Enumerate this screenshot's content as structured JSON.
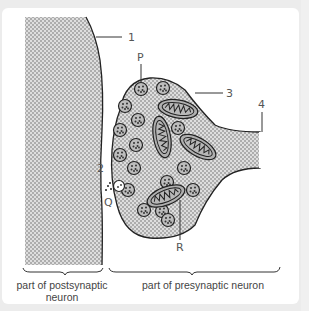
{
  "diagram": {
    "labels": {
      "l1": "1",
      "l2": "2",
      "l3": "3",
      "l4": "4",
      "P": "P",
      "Q": "Q",
      "R": "R"
    },
    "captions": {
      "postsynaptic": "part of postsynaptic neuron",
      "presynaptic": "part of presynaptic neuron"
    },
    "colors": {
      "fill": "#d9d9d9",
      "stipple": "#7a7a7a",
      "outline": "#222222",
      "mito_fill": "#a8a8a8",
      "background": "#ffffff"
    }
  }
}
